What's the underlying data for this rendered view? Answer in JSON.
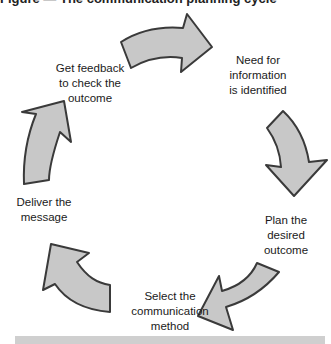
{
  "diagram": {
    "title": "Figure — The communication planning cycle",
    "steps": [
      {
        "id": "need",
        "label_lines": [
          "Need for",
          "information",
          "is identified"
        ]
      },
      {
        "id": "plan",
        "label_lines": [
          "Plan the",
          "desired",
          "outcome"
        ]
      },
      {
        "id": "select",
        "label_lines": [
          "Select the",
          "communication",
          "method"
        ]
      },
      {
        "id": "deliver",
        "label_lines": [
          "Deliver the",
          "message"
        ]
      },
      {
        "id": "feedback",
        "label_lines": [
          "Get feedback",
          "to check the",
          "outcome"
        ]
      }
    ],
    "flow": "clockwise",
    "arrow_count": 5,
    "colors": {
      "arrow_fill": "#c8c8c8",
      "arrow_stroke": "#3a3a3a",
      "bottom_bar": "#cfcfcf"
    }
  }
}
